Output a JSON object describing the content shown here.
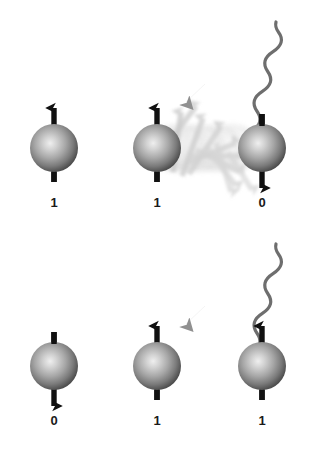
{
  "figure": {
    "background_color": "#ffffff",
    "width": 311,
    "height": 451
  },
  "style": {
    "arrow_color": "#111111",
    "photon_color": "#6e6e6e",
    "photon_head_color": "#8c8c8c",
    "ghost_color": "#c9c9c9",
    "sphere_highlight": "#e8e8e8",
    "sphere_mid": "#9a9a9a",
    "sphere_edge": "#3f3f3f",
    "label_color": "#1a1a1a"
  },
  "rows": [
    {
      "name": "top-row",
      "qubits": [
        {
          "id": "top-left",
          "label": "1",
          "spin": "up",
          "cx": 54,
          "cy": 148,
          "r": 24,
          "label_x": 54,
          "label_y": 203
        },
        {
          "id": "top-middle",
          "label": "1",
          "spin": "up",
          "cx": 157,
          "cy": 148,
          "r": 24,
          "label_x": 157,
          "label_y": 203
        },
        {
          "id": "top-right",
          "label": "0",
          "spin": "down",
          "cx": 262,
          "cy": 148,
          "r": 24,
          "label_x": 262,
          "label_y": 203
        }
      ],
      "photon": {
        "id": "photon-top",
        "icon": "wavy-arrow-icon",
        "start_x": 276,
        "start_y": 22,
        "end_x": 190,
        "end_y": 100,
        "direction": "down-left"
      },
      "blur_trail": {
        "id": "spin-flip-blur-top",
        "from_x": 157,
        "to_x": 262,
        "cy": 148,
        "description": "motion blurred ghost spheres and fanning arrows showing spin flip"
      }
    },
    {
      "name": "bottom-row",
      "qubits": [
        {
          "id": "bottom-left",
          "label": "0",
          "spin": "down",
          "cx": 54,
          "cy": 366,
          "r": 24,
          "label_x": 54,
          "label_y": 421
        },
        {
          "id": "bottom-middle",
          "label": "1",
          "spin": "up",
          "cx": 157,
          "cy": 366,
          "r": 24,
          "label_x": 157,
          "label_y": 421
        },
        {
          "id": "bottom-right",
          "label": "1",
          "spin": "up",
          "cx": 262,
          "cy": 366,
          "r": 24,
          "label_x": 262,
          "label_y": 421
        }
      ],
      "photon": {
        "id": "photon-bottom",
        "icon": "wavy-arrow-icon",
        "start_x": 276,
        "start_y": 244,
        "end_x": 190,
        "end_y": 320,
        "direction": "down-left"
      },
      "blur_trail": null
    }
  ],
  "labels": {
    "top": [
      "1",
      "1",
      "0"
    ],
    "bottom": [
      "0",
      "1",
      "1"
    ]
  }
}
